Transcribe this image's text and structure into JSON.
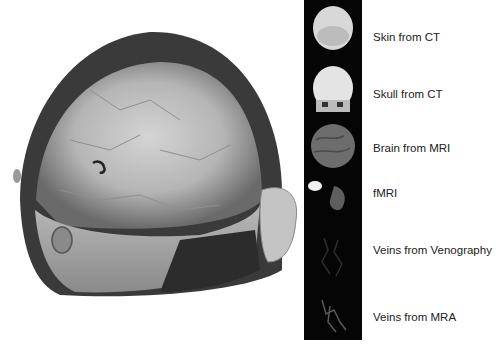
{
  "figure": {
    "main_image": {
      "description": "3D volume rendering of head combining skin, skull, brain and vessel layers"
    },
    "panels": [
      {
        "label": "Skin from CT",
        "top": 38
      },
      {
        "label": "Skull from CT",
        "top": 95
      },
      {
        "label": "Brain from MRI",
        "top": 148
      },
      {
        "label": "fMRI",
        "top": 194
      },
      {
        "label": "Veins from Venography",
        "top": 247
      },
      {
        "label": "Veins from MRA",
        "top": 314
      }
    ]
  }
}
